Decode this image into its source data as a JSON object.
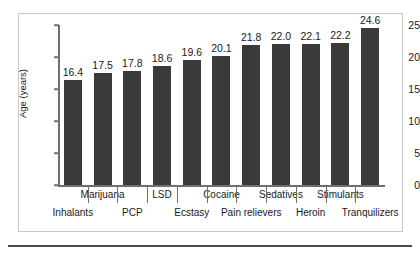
{
  "chart_data": {
    "type": "bar",
    "title": "",
    "xlabel": "",
    "ylabel": "Age (years)",
    "ylim": [
      0,
      25
    ],
    "yticks": [
      0,
      5,
      10,
      15,
      20,
      25
    ],
    "grid": false,
    "legend": null,
    "categories": [
      "Inhalants",
      "Marijuana",
      "PCP",
      "LSD",
      "Ecstasy",
      "Cocaine",
      "Pain relievers",
      "Sedatives",
      "Heroin",
      "Stimulants",
      "Tranquilizers"
    ],
    "values": [
      16.4,
      17.5,
      17.8,
      18.6,
      19.6,
      20.1,
      21.8,
      22.0,
      22.1,
      22.2,
      24.6
    ],
    "value_labels": [
      "16.4",
      "17.5",
      "17.8",
      "18.6",
      "19.6",
      "20.1",
      "21.8",
      "22.0",
      "22.1",
      "22.2",
      "24.6"
    ],
    "label_rows": [
      "lower",
      "upper",
      "lower",
      "upper",
      "lower",
      "upper",
      "lower",
      "upper",
      "lower",
      "upper",
      "lower"
    ]
  },
  "colors": {
    "bar": "#3a3a3a",
    "axis": "#6f6f6f",
    "frame": "#c9c9c9",
    "text": "#1a1a1a",
    "rule": "#4a4a4a",
    "background": "#ffffff"
  }
}
